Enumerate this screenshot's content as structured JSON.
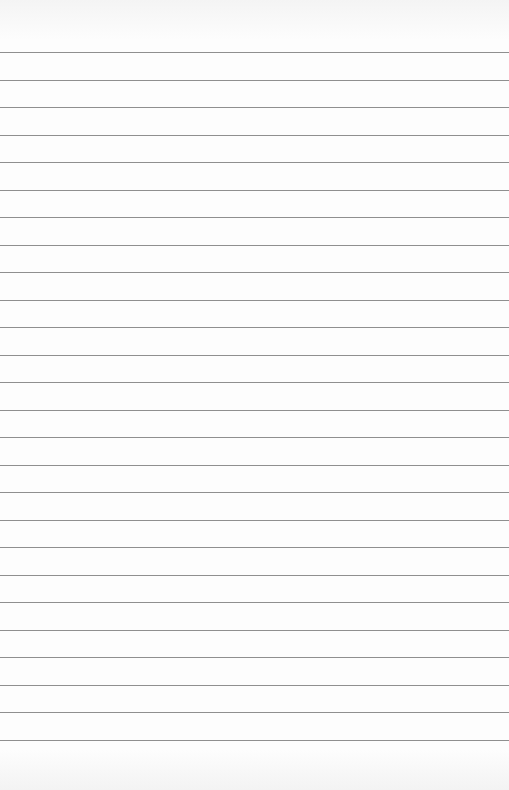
{
  "page": {
    "type": "lined-paper",
    "line_count": 26,
    "first_line_y": 52,
    "line_spacing": 27.5,
    "line_color": "#8f8f8f",
    "background_color": "#fdfdfd"
  }
}
